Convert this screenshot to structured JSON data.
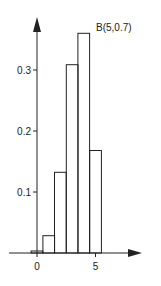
{
  "chart_data": {
    "type": "bar",
    "title": "",
    "annotation": "B(5,0.7)",
    "xlabel": "",
    "ylabel": "",
    "categories": [
      0,
      1,
      2,
      3,
      4,
      5
    ],
    "values": [
      0.0024,
      0.0284,
      0.1323,
      0.3087,
      0.3602,
      0.1681
    ],
    "x_ticks": [
      "0",
      "5"
    ],
    "y_ticks": [
      "0.1",
      "0.2",
      "0.3"
    ],
    "ylim": [
      0,
      0.4
    ],
    "grid": false,
    "legend": "none"
  }
}
